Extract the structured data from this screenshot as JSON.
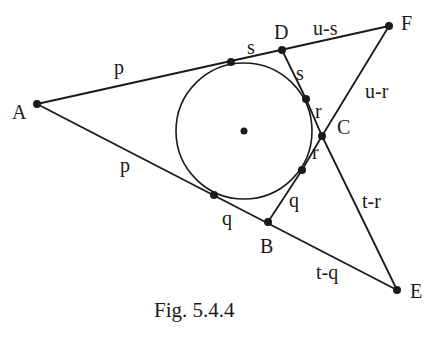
{
  "figure": {
    "caption": "Fig. 5.4.4",
    "stroke_color": "#1a1a1a",
    "background": "#ffffff"
  },
  "points": {
    "A": {
      "label": "A",
      "x": 37,
      "y": 104
    },
    "B": {
      "label": "B",
      "x": 268,
      "y": 222
    },
    "C": {
      "label": "C",
      "x": 322,
      "y": 136
    },
    "D": {
      "label": "D",
      "x": 282,
      "y": 50
    },
    "E": {
      "label": "E",
      "x": 397,
      "y": 290
    },
    "F": {
      "label": "F",
      "x": 389,
      "y": 26
    },
    "O": {
      "label": "",
      "x": 244,
      "y": 131
    }
  },
  "tangent_points": [
    {
      "name": "tangent-AD",
      "x": 231,
      "y": 62
    },
    {
      "name": "tangent-DB-upper",
      "x": 306,
      "y": 99
    },
    {
      "name": "tangent-DB-lower",
      "x": 302,
      "y": 170
    },
    {
      "name": "tangent-AB",
      "x": 214,
      "y": 195
    }
  ],
  "circle": {
    "cx": 244,
    "cy": 131,
    "r": 68
  },
  "segment_labels": {
    "AD_upper": "p",
    "AB_lower": "p",
    "tangent_to_D": "s",
    "D_to_tangent": "s",
    "DF": "u-s",
    "FC": "u-r",
    "upper_r": "r",
    "lower_r": "r",
    "tangent_to_B": "q",
    "B_side_q": "q",
    "CE": "t-r",
    "BE": "t-q"
  }
}
